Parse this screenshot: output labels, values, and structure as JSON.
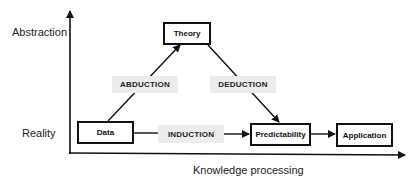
{
  "axes": {
    "y_top_label": "Abstraction",
    "y_bottom_label": "Reality",
    "x_label": "Knowledge processing"
  },
  "nodes": {
    "theory": "Theory",
    "data": "Data",
    "predictability": "Predictability",
    "application": "Application"
  },
  "edges": {
    "abduction": "ABDUCTION",
    "deduction": "DEDUCTION",
    "induction": "INDUCTION"
  },
  "colors": {
    "line": "#111111",
    "label_bg": "#ececec"
  }
}
